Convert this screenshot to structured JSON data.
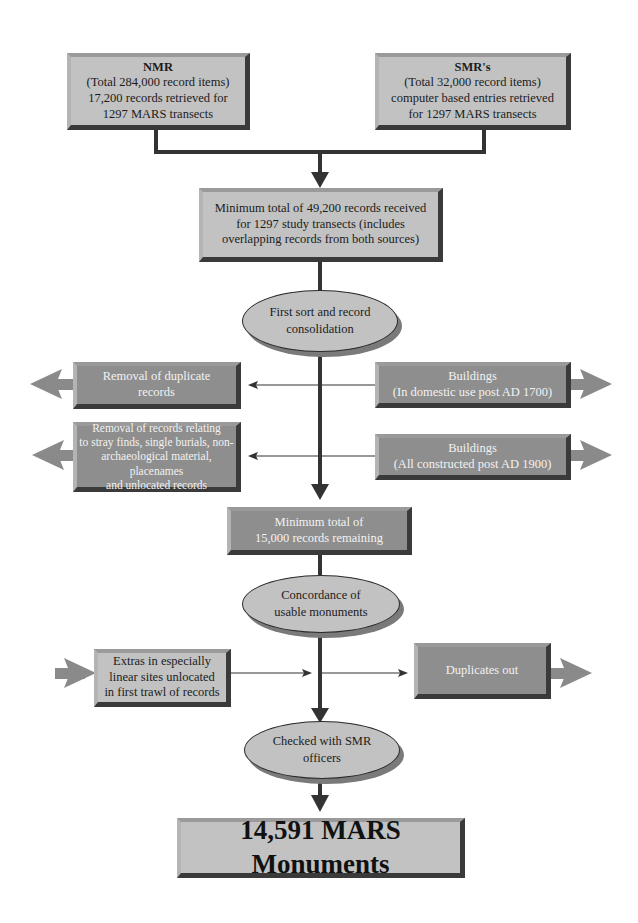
{
  "diagram": {
    "sources": {
      "nmr": {
        "title": "NMR",
        "lines": [
          "(Total 284,000 record items)",
          "17,200 records retrieved for",
          "1297  MARS transects"
        ]
      },
      "smr": {
        "title": "SMR's",
        "lines": [
          "(Total 32,000 record items)",
          "computer based entries retrieved",
          "for 1297 MARS transects"
        ]
      }
    },
    "combined": {
      "lines": [
        "Minimum total of 49,200 records received",
        "for 1297 study transects (includes",
        "overlapping records from both sources)"
      ]
    },
    "first_sort": {
      "lines": [
        "First sort and record",
        "consolidation"
      ]
    },
    "removals_left": [
      {
        "lines": [
          "Removal of duplicate",
          "records"
        ]
      },
      {
        "lines": [
          "Removal of records relating",
          "to stray finds, single burials, non-",
          "archaeological  material, placenames",
          "and unlocated records"
        ]
      }
    ],
    "removals_right": [
      {
        "lines": [
          "Buildings",
          "(In domestic use post AD 1700)"
        ]
      },
      {
        "lines": [
          "Buildings",
          "(All constructed post AD 1900)"
        ]
      }
    ],
    "remaining": {
      "lines": [
        "Minimum total of",
        "15,000 records remaining"
      ]
    },
    "concordance": {
      "lines": [
        "Concordance of",
        "usable monuments"
      ]
    },
    "extras_in": {
      "lines": [
        "Extras in especially",
        "linear sites unlocated",
        "in first trawl of records"
      ]
    },
    "duplicates_out": {
      "lines": [
        "Duplicates out"
      ]
    },
    "checked": {
      "lines": [
        "Checked with SMR",
        "officers"
      ]
    },
    "final": {
      "label": "14,591 MARS Monuments"
    }
  },
  "colors": {
    "light_box": "#c2c2c2",
    "dark_box": "#8e8e8e",
    "arrow_gray": "#8a8a8a",
    "line_dark": "#333333"
  }
}
